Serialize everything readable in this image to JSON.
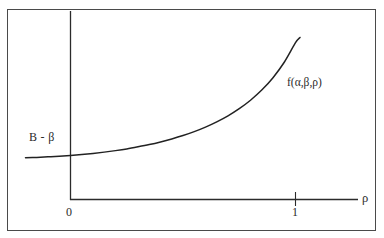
{
  "figure": {
    "background_color": "#ffffff",
    "frame_color": "#4a4a4a",
    "ink_color": "#2b2b2b"
  },
  "labels": {
    "y_intercept": "B - β",
    "curve_function": "f(α,β,ρ)",
    "x_tick_zero": "0",
    "x_tick_one": "1",
    "x_axis_name": "ρ"
  },
  "chart_data": {
    "type": "line",
    "title": "",
    "xlabel": "ρ",
    "ylabel": "",
    "grid": false,
    "legend": null,
    "xlim": [
      -0.2,
      1.28
    ],
    "ylim": [
      0,
      1.0
    ],
    "xticks": [
      0,
      1
    ],
    "xticklabels": [
      "0",
      "1"
    ],
    "yticks": [],
    "yticklabels": [],
    "annotations": [
      {
        "text": "B - β",
        "x": -0.02,
        "y": 0.28,
        "role": "y-intercept-value"
      },
      {
        "text": "f(α,β,ρ)",
        "x": 1.02,
        "y": 0.64,
        "role": "curve-name"
      }
    ],
    "series": [
      {
        "name": "f(α,β,ρ)",
        "color": "#222222",
        "x": [
          -0.2,
          -0.15,
          -0.1,
          -0.05,
          0.0,
          0.05,
          0.1,
          0.15,
          0.2,
          0.25,
          0.3,
          0.35,
          0.4,
          0.45,
          0.5,
          0.55,
          0.6,
          0.65,
          0.7,
          0.75,
          0.8,
          0.85,
          0.9,
          0.95,
          1.0,
          1.02
        ],
        "y": [
          0.222,
          0.224,
          0.227,
          0.23,
          0.234,
          0.239,
          0.245,
          0.252,
          0.26,
          0.269,
          0.28,
          0.292,
          0.306,
          0.322,
          0.34,
          0.361,
          0.385,
          0.413,
          0.445,
          0.483,
          0.528,
          0.582,
          0.648,
          0.73,
          0.834,
          0.862
        ]
      }
    ]
  }
}
